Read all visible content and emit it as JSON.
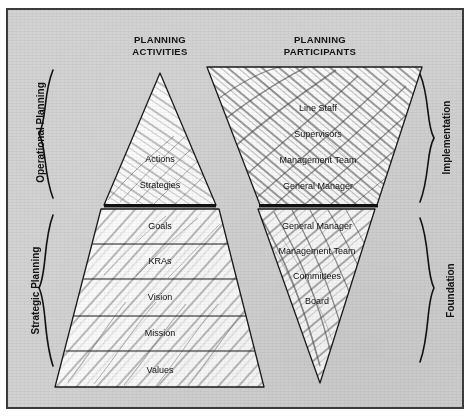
{
  "diagram": {
    "headers": {
      "left": {
        "line1": "PLANNING",
        "line2": "ACTIVITIES"
      },
      "right": {
        "line1": "PLANNING",
        "line2": "PARTICIPANTS"
      }
    },
    "left_braces": [
      {
        "label": "Operational Planning"
      },
      {
        "label": "Strategic Planning"
      }
    ],
    "right_braces": [
      {
        "label": "Implementation"
      },
      {
        "label": "Foundation"
      }
    ],
    "activities_pyramid": {
      "upper_levels": [
        {
          "label": "Actions"
        },
        {
          "label": "Strategies"
        }
      ],
      "lower_levels": [
        {
          "label": "Goals"
        },
        {
          "label": "KRAs"
        },
        {
          "label": "Vision"
        },
        {
          "label": "Mission"
        },
        {
          "label": "Values"
        }
      ]
    },
    "participants_pyramid": {
      "upper_levels": [
        {
          "label": "Line Staff"
        },
        {
          "label": "Supervisors"
        },
        {
          "label": "Management Team"
        },
        {
          "label": "General Manager"
        }
      ],
      "lower_levels": [
        {
          "label": "General Manager"
        },
        {
          "label": "Management Team"
        },
        {
          "label": "Committees"
        },
        {
          "label": "Board"
        }
      ]
    },
    "colors": {
      "plate_background": "#d2d2d2",
      "plate_border": "#3b3b3b",
      "shape_fill": "#fbfbfb",
      "shape_stroke": "#1a1a1a",
      "divider_bar": "#111111",
      "text": "#0d0d0d"
    }
  }
}
